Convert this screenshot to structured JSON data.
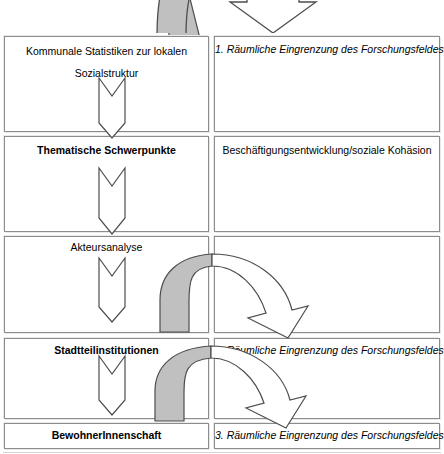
{
  "diagram": {
    "colors": {
      "arrow_fill_gray": "#c0c0c0",
      "outline": "#4d4d4d",
      "box_border": "#8c8c8c",
      "box_shadow": "#e9e9e9",
      "background": "#ffffff",
      "text": "#000000"
    },
    "rows": [
      {
        "id": "row-1",
        "left": {
          "label_line1": "Kommunale Statistiken zur lokalen",
          "label_line2": "Sozialstruktur",
          "style": "regular",
          "has_down_arrow": true
        },
        "right": {
          "label": "1. Räumliche Eingrenzung des Forschungsfeldes",
          "style": "italic"
        }
      },
      {
        "id": "row-2",
        "left": {
          "label_line1": "Thematische Schwerpunkte",
          "label_line2": "",
          "style": "bold",
          "has_down_arrow": true
        },
        "right": {
          "label": "Beschäftigungsentwicklung/soziale Kohäsion",
          "style": "regular"
        }
      },
      {
        "id": "row-3",
        "left": {
          "label_line1": "Akteursanalyse",
          "label_line2": "",
          "style": "regular",
          "has_down_arrow": true
        },
        "right": {
          "label": "",
          "style": "regular"
        }
      },
      {
        "id": "row-4",
        "left": {
          "label_line1": "Stadtteilinstitutionen",
          "label_line2": "",
          "style": "bold",
          "has_down_arrow": true
        },
        "right": {
          "label": "2. Räumliche Eingrenzung des Forschungsfeldes",
          "style": "italic"
        }
      },
      {
        "id": "row-5",
        "left": {
          "label_line1": "BewohnerInnenschaft",
          "label_line2": "",
          "style": "bold",
          "has_down_arrow": false
        },
        "right": {
          "label": "3. Räumliche Eingrenzung des Forschungsfeldes",
          "style": "italic"
        }
      }
    ],
    "connectors": [
      {
        "id": "curved-arrow-top",
        "kind": "curved-arch-arrow",
        "fill": "half-gray",
        "direction": "left-to-right-down",
        "clipped": true
      },
      {
        "id": "curved-arrow-middle",
        "kind": "curved-arch-arrow",
        "fill": "half-gray",
        "direction": "left-to-right-down",
        "clipped": false
      },
      {
        "id": "curved-arrow-bottom",
        "kind": "curved-arch-arrow",
        "fill": "half-gray",
        "direction": "left-to-right-down",
        "clipped": false
      }
    ]
  }
}
